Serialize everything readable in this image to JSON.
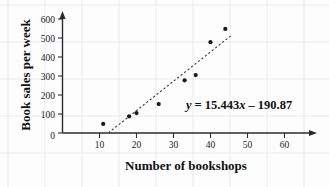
{
  "chart_data": {
    "type": "scatter",
    "title": "",
    "xlabel": "Number of bookshops",
    "ylabel": "Book sales per week",
    "xlim": [
      0,
      65
    ],
    "ylim": [
      0,
      640
    ],
    "xticks": [
      0,
      10,
      20,
      30,
      40,
      50,
      60
    ],
    "yticks": [
      0,
      100,
      200,
      300,
      400,
      500,
      600
    ],
    "grid": true,
    "legend": "none",
    "x": [
      11,
      18,
      20,
      26,
      33,
      36,
      40,
      44
    ],
    "y": [
      48,
      88,
      105,
      152,
      277,
      305,
      478,
      548
    ],
    "points": [
      {
        "x": 11,
        "y": 48
      },
      {
        "x": 18,
        "y": 88
      },
      {
        "x": 20,
        "y": 105
      },
      {
        "x": 26,
        "y": 152
      },
      {
        "x": 33,
        "y": 277
      },
      {
        "x": 36,
        "y": 305
      },
      {
        "x": 40,
        "y": 478
      },
      {
        "x": 44,
        "y": 548
      }
    ],
    "trendline": {
      "style": "dashed",
      "slope": 15.443,
      "intercept": -190.87,
      "x_start": 12.4,
      "x_end": 45.5,
      "equation": "y = 15.443x – 190.87"
    },
    "annotations": [
      {
        "name": "regression-equation",
        "text": "y = 15.443x – 190.87",
        "parts": {
          "variable": "y",
          "body": "= 15.443",
          "x_variable": "x",
          "tail": "– 190.87"
        }
      }
    ]
  },
  "axes": {
    "x_title": "Number of bookshops",
    "y_title": "Book sales per week",
    "x_tick_labels": [
      "0",
      "10",
      "20",
      "30",
      "40",
      "50",
      "60"
    ],
    "y_tick_labels": [
      "0",
      "100",
      "200",
      "300",
      "400",
      "500",
      "600"
    ],
    "origin_label": "0"
  },
  "colors": {
    "point": "#1a1a1a",
    "axis": "#2b2b2b",
    "trendline": "#3a3a3a",
    "grid": "#e3e3e8",
    "background": "#fdfdfd",
    "text": "#111111"
  }
}
